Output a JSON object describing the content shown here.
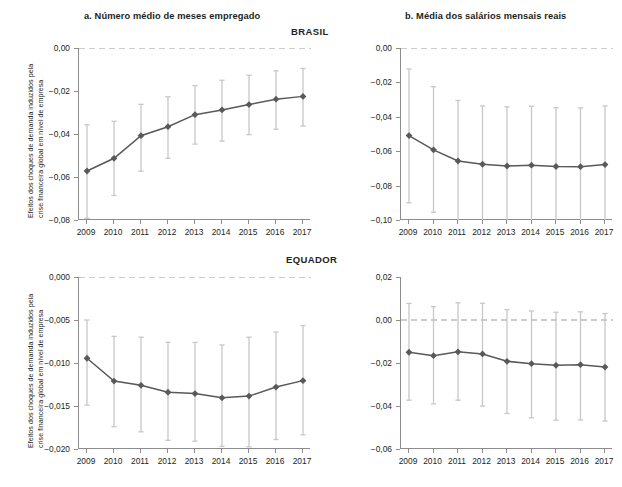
{
  "figure": {
    "panel_titles": {
      "a": "a. Número médio de meses empregado",
      "b": "b. Média dos salários mensais reais"
    },
    "country_labels": {
      "top": "BRASIL",
      "bottom": "EQUADOR"
    },
    "y_axis_title": {
      "line1": "Efeitos dos choques de demanda induzidos pela",
      "line2": "crise financeira global em nível de empresa"
    },
    "colors": {
      "line": "#58595b",
      "marker": "#58595b",
      "error_bar": "#c6c7c9",
      "axis": "#8d8d8d",
      "zero_line": "#9a9a9a",
      "text": "#231f20",
      "background": "#ffffff"
    }
  },
  "chart_data": [
    {
      "id": "brasil-meses-empregado",
      "type": "line",
      "title": "a. Número médio de meses empregado",
      "group": "BRASIL",
      "xlabel": "",
      "ylabel": "Efeitos dos choques de demanda induzidos pela crise financeira global em nível de empresa",
      "categories": [
        "2009",
        "2010",
        "2011",
        "2012",
        "2013",
        "2014",
        "2015",
        "2016",
        "2017"
      ],
      "x": [
        2009,
        2010,
        2011,
        2012,
        2013,
        2014,
        2015,
        2016,
        2017
      ],
      "values": [
        -0.0572,
        -0.0513,
        -0.0408,
        -0.0366,
        -0.031,
        -0.0288,
        -0.0263,
        -0.0238,
        -0.0225
      ],
      "error_low": [
        -0.0792,
        -0.0686,
        -0.0573,
        -0.0513,
        -0.0447,
        -0.0433,
        -0.0403,
        -0.0378,
        -0.0363
      ],
      "error_high": [
        -0.0357,
        -0.0341,
        -0.0262,
        -0.0227,
        -0.0175,
        -0.015,
        -0.0127,
        -0.0106,
        -0.0095
      ],
      "ylim": [
        -0.08,
        0.0
      ],
      "yticks": [
        0.0,
        -0.02,
        -0.04,
        -0.06,
        -0.08
      ],
      "ytick_labels": [
        "0,00",
        "−0,02",
        "−0,04",
        "−0,06",
        "−0,08"
      ],
      "zero_reference_line": 0.0,
      "grid": false,
      "legend": "none"
    },
    {
      "id": "brasil-salarios-mensais",
      "type": "line",
      "title": "b. Média dos salários mensais reais",
      "group": "BRASIL",
      "xlabel": "",
      "ylabel": "",
      "categories": [
        "2009",
        "2010",
        "2011",
        "2012",
        "2013",
        "2014",
        "2015",
        "2016",
        "2017"
      ],
      "x": [
        2009,
        2010,
        2011,
        2012,
        2013,
        2014,
        2015,
        2016,
        2017
      ],
      "values": [
        -0.0509,
        -0.0592,
        -0.0657,
        -0.0676,
        -0.0686,
        -0.0681,
        -0.0689,
        -0.069,
        -0.0678
      ],
      "error_low": [
        -0.09,
        -0.0955,
        -0.101,
        -0.102,
        -0.103,
        -0.1025,
        -0.1035,
        -0.1035,
        -0.102
      ],
      "error_high": [
        -0.0122,
        -0.0225,
        -0.0305,
        -0.0337,
        -0.0342,
        -0.0339,
        -0.0347,
        -0.0348,
        -0.0337
      ],
      "ylim": [
        -0.1,
        0.0
      ],
      "yticks": [
        0.0,
        -0.02,
        -0.04,
        -0.06,
        -0.08,
        -0.1
      ],
      "ytick_labels": [
        "0,00",
        "−0,02",
        "−0,04",
        "−0,06",
        "−0,08",
        "−0,10"
      ],
      "zero_reference_line": 0.0,
      "grid": false,
      "legend": "none"
    },
    {
      "id": "equador-meses-empregado",
      "type": "line",
      "title": "a. Número médio de meses empregado",
      "group": "EQUADOR",
      "xlabel": "",
      "ylabel": "Efeitos dos choques de demanda induzidos pela crise financeira global em nível de empresa",
      "categories": [
        "2009",
        "2010",
        "2011",
        "2012",
        "2013",
        "2014",
        "2015",
        "2016",
        "2017"
      ],
      "x": [
        2009,
        2010,
        2011,
        2012,
        2013,
        2014,
        2015,
        2016,
        2017
      ],
      "values": [
        -0.00945,
        -0.0121,
        -0.0126,
        -0.0134,
        -0.01355,
        -0.01405,
        -0.01385,
        -0.0128,
        -0.01205
      ],
      "error_low": [
        -0.0149,
        -0.0174,
        -0.018,
        -0.019,
        -0.0191,
        -0.0197,
        -0.01975,
        -0.0189,
        -0.01835
      ],
      "error_high": [
        -0.005,
        -0.0069,
        -0.007,
        -0.0076,
        -0.0076,
        -0.0079,
        -0.007,
        -0.0064,
        -0.00565
      ],
      "ylim": [
        -0.02,
        0.0
      ],
      "yticks": [
        0.0,
        -0.005,
        -0.01,
        -0.015,
        -0.02
      ],
      "ytick_labels": [
        "0,000",
        "−0,005",
        "−0,010",
        "−0,015",
        "−0,020"
      ],
      "zero_reference_line": 0.0,
      "grid": false,
      "legend": "none"
    },
    {
      "id": "equador-salarios-mensais",
      "type": "line",
      "title": "b. Média dos salários mensais reais",
      "group": "EQUADOR",
      "xlabel": "",
      "ylabel": "",
      "categories": [
        "2009",
        "2010",
        "2011",
        "2012",
        "2013",
        "2014",
        "2015",
        "2016",
        "2017"
      ],
      "x": [
        2009,
        2010,
        2011,
        2012,
        2013,
        2014,
        2015,
        2016,
        2017
      ],
      "values": [
        -0.015,
        -0.0166,
        -0.0148,
        -0.0158,
        -0.0192,
        -0.0203,
        -0.0211,
        -0.0208,
        -0.0219
      ],
      "error_low": [
        -0.0373,
        -0.039,
        -0.0373,
        -0.04,
        -0.0435,
        -0.0455,
        -0.0466,
        -0.0465,
        -0.047
      ],
      "error_high": [
        0.0077,
        0.0062,
        0.008,
        0.0078,
        0.0048,
        0.0042,
        0.0036,
        0.0038,
        0.003
      ],
      "ylim": [
        -0.06,
        0.02
      ],
      "yticks": [
        0.02,
        0.0,
        -0.02,
        -0.04,
        -0.06
      ],
      "ytick_labels": [
        "0,02",
        "0,00",
        "−0,02",
        "−0,04",
        "−0,06"
      ],
      "zero_reference_line": 0.0,
      "grid": false,
      "legend": "none"
    }
  ]
}
